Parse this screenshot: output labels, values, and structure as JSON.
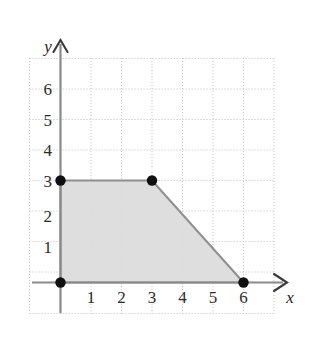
{
  "figure": {
    "background_color": "#ffffff",
    "grid_color": "#c9c9c9",
    "axis_color": "#8a8a8a",
    "region_fill": "#dcdcdc",
    "region_stroke": "#8f8f8f",
    "vertex_color": "#101010"
  },
  "axes": {
    "x_label": "x",
    "y_label": "y",
    "x_ticks": [
      "1",
      "2",
      "3",
      "4",
      "5",
      "6"
    ],
    "y_ticks": [
      "1",
      "2",
      "3",
      "4",
      "5",
      "6"
    ],
    "x_arrow": "right-arrow-icon",
    "y_arrow": "up-arrow-icon"
  },
  "chart_data": {
    "type": "scatter",
    "title": "",
    "xlabel": "x",
    "ylabel": "y",
    "xlim": [
      -0.95,
      7.8
    ],
    "ylim": [
      -0.95,
      7.5
    ],
    "grid": true,
    "grid_style": "dotted",
    "grid_spacing": 1,
    "legend": "none",
    "x_ticks": [
      1,
      2,
      3,
      4,
      5,
      6
    ],
    "y_ticks": [
      1,
      2,
      3,
      4,
      5,
      6
    ],
    "annotations": [],
    "series": [
      {
        "name": "Feasible region",
        "kind": "shaded-polygon",
        "closed": true,
        "fill": "#dcdcdc",
        "stroke": "#8f8f8f",
        "vertices": [
          {
            "x": 0,
            "y": 0,
            "marked": true
          },
          {
            "x": 0,
            "y": 3,
            "marked": true
          },
          {
            "x": 3,
            "y": 3,
            "marked": true
          },
          {
            "x": 6,
            "y": 0,
            "marked": true
          }
        ],
        "edges": [
          {
            "from": [
              0,
              0
            ],
            "to": [
              0,
              3
            ],
            "description": "x = 0"
          },
          {
            "from": [
              0,
              3
            ],
            "to": [
              3,
              3
            ],
            "description": "y = 3"
          },
          {
            "from": [
              3,
              3
            ],
            "to": [
              6,
              0
            ],
            "description": "x + y = 6"
          },
          {
            "from": [
              6,
              0
            ],
            "to": [
              0,
              0
            ],
            "description": "y = 0"
          }
        ]
      },
      {
        "name": "Corner points",
        "kind": "scatter",
        "marker": "filled-circle",
        "color": "#101010",
        "x": [
          0,
          0,
          3,
          6
        ],
        "y": [
          0,
          3,
          3,
          0
        ]
      }
    ]
  }
}
